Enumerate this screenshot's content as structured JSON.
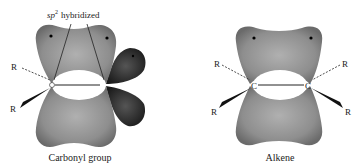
{
  "figure": {
    "panels": [
      {
        "caption": "Carbonyl group",
        "annotation": {
          "prefix": "sp",
          "superscript": "2",
          "text": "hybridized"
        },
        "substituents": [
          "R",
          "R"
        ],
        "atoms": [
          "C",
          "O"
        ]
      },
      {
        "caption": "Alkene",
        "substituents": [
          "R",
          "R",
          "R",
          "R"
        ],
        "atoms": [
          "C",
          "C"
        ]
      }
    ],
    "colors": {
      "pi_orbital": "#8a8a8a",
      "lone_pair_lobes": "#2a2a2a",
      "background": "#ffffff"
    }
  }
}
